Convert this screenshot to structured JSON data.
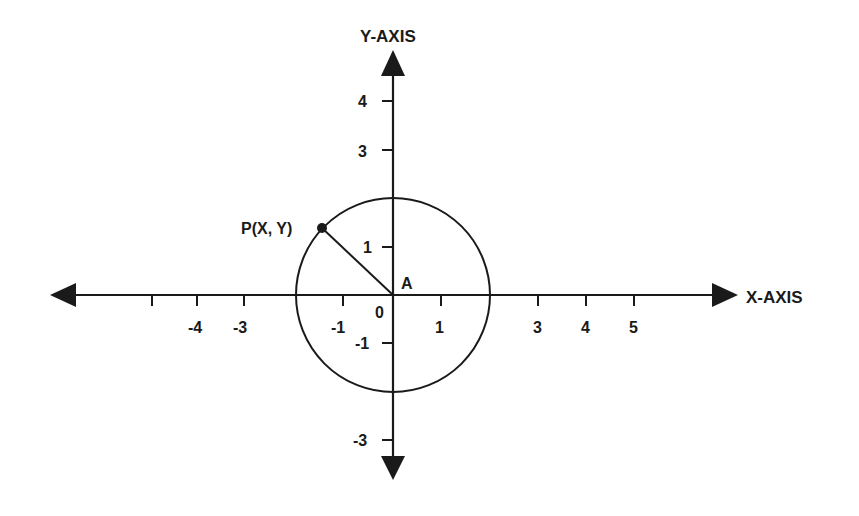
{
  "diagram": {
    "type": "unit-circle-coordinate-plane",
    "colors": {
      "ink": "#1a1a1a",
      "background": "#ffffff"
    },
    "axes": {
      "x_label": "X-AXIS",
      "y_label": "Y-AXIS"
    },
    "x_tick_labels": [
      {
        "value": -4,
        "text": "-4"
      },
      {
        "value": -3,
        "text": "-3"
      },
      {
        "value": -1,
        "text": "-1"
      },
      {
        "value": 0,
        "text": "0"
      },
      {
        "value": 1,
        "text": "1"
      },
      {
        "value": 3,
        "text": "3"
      },
      {
        "value": 4,
        "text": "4"
      },
      {
        "value": 5,
        "text": "5"
      }
    ],
    "y_tick_labels": [
      {
        "value": 4,
        "text": "4"
      },
      {
        "value": 3,
        "text": "3"
      },
      {
        "value": 1,
        "text": "1"
      },
      {
        "value": -1,
        "text": "-1"
      },
      {
        "value": -3,
        "text": "-3"
      }
    ],
    "circle": {
      "center_label": "A",
      "radius_units": 2
    },
    "point": {
      "label": "P(X, Y)"
    }
  }
}
